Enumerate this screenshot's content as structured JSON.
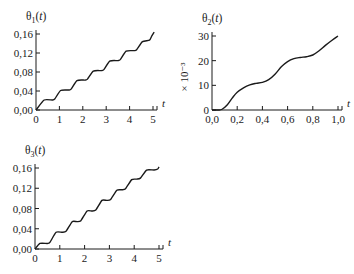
{
  "chart_data": [
    {
      "id": "theta1",
      "type": "line",
      "title": "θ1(t)",
      "title_main": "θ",
      "title_sub": "1",
      "title_arg": "(t)",
      "xlabel": "t",
      "ylabel": "",
      "xlim": [
        0,
        5
      ],
      "ylim": [
        0,
        0.16
      ],
      "xticks": [
        0,
        1,
        2,
        3,
        4,
        5
      ],
      "xtick_labels": [
        "0",
        "1",
        "2",
        "3",
        "4",
        "5"
      ],
      "yticks": [
        0,
        0.04,
        0.08,
        0.12,
        0.16
      ],
      "ytick_labels": [
        "0,00",
        "0,04",
        "0,08",
        "0,12",
        "0,16"
      ],
      "grid": false,
      "frame": {
        "x0": 36,
        "x1": 153,
        "y0": 110,
        "y1": 34
      },
      "series": [
        {
          "name": "θ1(t)",
          "shape": "staircase",
          "x": [
            0,
            0.35,
            0.7,
            0.8,
            1.05,
            1.4,
            1.5,
            1.75,
            2.1,
            2.2,
            2.45,
            2.8,
            2.9,
            3.15,
            3.5,
            3.6,
            3.85,
            4.2,
            4.3,
            4.55,
            4.85,
            4.95,
            5.05
          ],
          "values": [
            0,
            0.021,
            0.021,
            0.023,
            0.041,
            0.042,
            0.044,
            0.062,
            0.063,
            0.065,
            0.082,
            0.083,
            0.085,
            0.103,
            0.104,
            0.106,
            0.124,
            0.125,
            0.127,
            0.144,
            0.147,
            0.156,
            0.164
          ]
        }
      ]
    },
    {
      "id": "theta2",
      "type": "line",
      "title": "θ2(t)",
      "title_main": "θ",
      "title_sub": "2",
      "title_arg": "(t)",
      "xlabel": "t",
      "ylabel": "× 10⁻³",
      "xlim": [
        0,
        1
      ],
      "ylim": [
        0,
        30
      ],
      "xticks": [
        0,
        0.2,
        0.4,
        0.6,
        0.8,
        1.0
      ],
      "xtick_labels": [
        "0,0",
        "0,2",
        "0,4",
        "0,6",
        "0,8",
        "1,0"
      ],
      "yticks": [
        0,
        10,
        20,
        30
      ],
      "ytick_labels": [
        "0",
        "10",
        "20",
        "30"
      ],
      "grid": false,
      "frame": {
        "x0": 212,
        "x1": 338,
        "y0": 110,
        "y1": 36
      },
      "series": [
        {
          "name": "θ2(t)",
          "shape": "smooth",
          "x": [
            0,
            0.05,
            0.08,
            0.12,
            0.16,
            0.2,
            0.25,
            0.3,
            0.35,
            0.4,
            0.45,
            0.5,
            0.55,
            0.6,
            0.65,
            0.7,
            0.75,
            0.8,
            0.85,
            0.9,
            0.95,
            1.0
          ],
          "values": [
            0,
            0,
            0.3,
            2,
            4.8,
            7.2,
            9.0,
            10.2,
            10.8,
            11.2,
            12.3,
            14.5,
            17.5,
            19.6,
            20.8,
            21.3,
            21.6,
            22.3,
            24.0,
            26.2,
            28.2,
            30.0
          ]
        }
      ]
    },
    {
      "id": "theta3",
      "type": "line",
      "title": "θ3(t)",
      "title_main": "θ",
      "title_sub": "3",
      "title_arg": "(t)",
      "xlabel": "t",
      "ylabel": "",
      "xlim": [
        0,
        5
      ],
      "ylim": [
        0,
        0.16
      ],
      "xticks": [
        0,
        1,
        2,
        3,
        4,
        5
      ],
      "xtick_labels": [
        "0",
        "1",
        "2",
        "3",
        "4",
        "5"
      ],
      "yticks": [
        0,
        0.04,
        0.08,
        0.12,
        0.16
      ],
      "ytick_labels": [
        "0,00",
        "0,04",
        "0,08",
        "0,12",
        "0,16"
      ],
      "grid": false,
      "frame": {
        "x0": 35,
        "x1": 159,
        "y0": 249,
        "y1": 168
      },
      "series": [
        {
          "name": "θ3(t)",
          "shape": "staircase",
          "x": [
            0,
            0.2,
            0.5,
            0.6,
            0.85,
            1.1,
            1.25,
            1.5,
            1.7,
            1.85,
            2.1,
            2.3,
            2.45,
            2.7,
            2.9,
            3.05,
            3.3,
            3.5,
            3.65,
            3.9,
            4.1,
            4.25,
            4.5,
            4.8,
            4.95,
            5.0
          ],
          "values": [
            0,
            0.011,
            0.011,
            0.013,
            0.033,
            0.033,
            0.035,
            0.054,
            0.054,
            0.056,
            0.075,
            0.075,
            0.077,
            0.096,
            0.096,
            0.098,
            0.116,
            0.117,
            0.119,
            0.137,
            0.138,
            0.14,
            0.156,
            0.156,
            0.158,
            0.162
          ]
        }
      ]
    }
  ]
}
